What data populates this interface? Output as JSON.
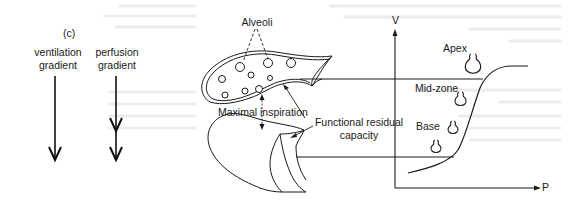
{
  "figure": {
    "panel_label": "(c)",
    "gradients": {
      "ventilation": {
        "line1": "ventilation",
        "line2": "gradient"
      },
      "perfusion": {
        "line1": "perfusion",
        "line2": "gradient"
      }
    },
    "lung": {
      "alveoli_label": "Alveoli",
      "maximal_inspiration_label": "Maximal inspiration",
      "frc_label_line1": "Functional residual",
      "frc_label_line2": "capacity"
    },
    "compliance_curve": {
      "y_axis_label": "V",
      "x_axis_label": "P",
      "zones": {
        "apex": "Apex",
        "mid": "Mid-zone",
        "base": "Base"
      }
    }
  },
  "colors": {
    "ink": "#1a1a1a",
    "background": "#ffffff",
    "show_through": "#e4e4e4"
  }
}
